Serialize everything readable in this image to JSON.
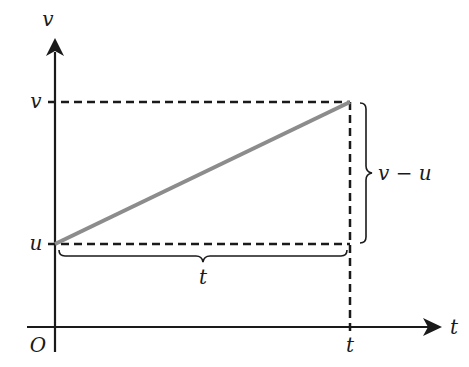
{
  "diagram": {
    "type": "velocity-time graph",
    "axes": {
      "y_label": "v",
      "x_label": "t",
      "origin_label": "O"
    },
    "tick_labels": {
      "v_level": "v",
      "u_level": "u",
      "t_level": "t"
    },
    "braces": {
      "horizontal_label": "t",
      "vertical_label": "v − u"
    },
    "colors": {
      "line": "#8c8c8c",
      "axes": "#1a1a1a",
      "dashed": "#1a1a1a"
    }
  }
}
